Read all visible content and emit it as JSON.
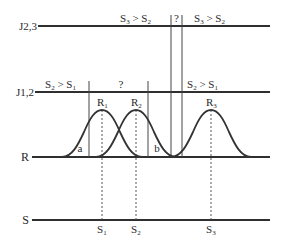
{
  "diagram": {
    "colors": {
      "line": "#2f2f2f",
      "text": "#2a2a2a",
      "background": "#ffffff"
    },
    "axes": [
      {
        "id": "J23",
        "label": "J2,3",
        "y": 26
      },
      {
        "id": "J12",
        "label": "J1,2",
        "y": 92
      },
      {
        "id": "R",
        "label": "R",
        "y": 157
      },
      {
        "id": "S",
        "label": "S",
        "y": 220
      }
    ],
    "j23_regions": [
      {
        "label": "S",
        "sub": "3",
        "op": " > ",
        "label2": "S",
        "sub2": "2"
      },
      {
        "label": "?"
      },
      {
        "label": "S",
        "sub": "3",
        "op": " > ",
        "label2": "S",
        "sub2": "2"
      }
    ],
    "j12_regions": [
      {
        "label": "S",
        "sub": "2",
        "op": " > ",
        "label2": "S",
        "sub2": "1"
      },
      {
        "label": "?"
      },
      {
        "label": "S",
        "sub": "2",
        "op": " > ",
        "label2": "S",
        "sub2": "1"
      }
    ],
    "responses": [
      {
        "label": "R",
        "sub": "1"
      },
      {
        "label": "R",
        "sub": "2"
      },
      {
        "label": "R",
        "sub": "3"
      }
    ],
    "stimuli": [
      {
        "label": "S",
        "sub": "1"
      },
      {
        "label": "S",
        "sub": "2"
      },
      {
        "label": "S",
        "sub": "3"
      }
    ],
    "regions_on_R": [
      {
        "label": "a"
      },
      {
        "label": "b"
      }
    ]
  }
}
